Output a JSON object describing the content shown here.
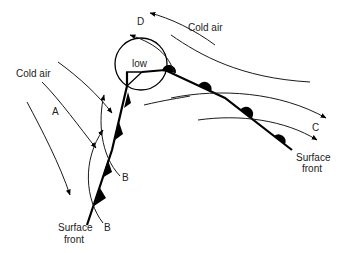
{
  "figure": {
    "type": "weather-front-diagram",
    "low_label": "low",
    "labels": {
      "cold_air_left": "Cold air",
      "cold_air_top": "Cold air",
      "a": "A",
      "b_upper": "B",
      "b_lower": "B",
      "c": "C",
      "d": "D",
      "surface_front_left_line1": "Surface",
      "surface_front_left_line2": "front",
      "surface_front_right_line1": "Surface",
      "surface_front_right_line2": "front"
    },
    "colors": {
      "line": "#000000",
      "background": "#ffffff"
    }
  }
}
